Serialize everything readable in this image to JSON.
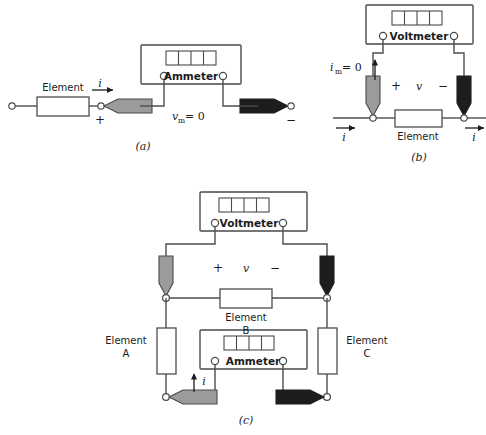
{
  "figure": {
    "background": "#ffffff",
    "colors": {
      "wire": "#4d4d4d",
      "probe_gray": "#9b9b9b",
      "probe_black": "#1d1d1d",
      "text": "#1b1b1b"
    }
  },
  "panel_a": {
    "caption": "(a)",
    "meter": {
      "name": "Ammeter",
      "display_segments": 4,
      "terminals": 2
    },
    "element_label": "Element",
    "current_label": "i",
    "plus_sign": "+",
    "minus_sign": "−",
    "meter_voltage": {
      "symbol": "v",
      "subscript": "m",
      "equals": "= 0",
      "full": "vₘ = 0"
    },
    "probes": [
      {
        "name": "positive-probe",
        "color": "gray",
        "direction": "left"
      },
      {
        "name": "negative-probe",
        "color": "black",
        "direction": "right"
      }
    ]
  },
  "panel_b": {
    "caption": "(b)",
    "meter": {
      "name": "Voltmeter",
      "display_segments": 4,
      "terminals": 2
    },
    "element_label": "Element",
    "voltage_label": "v",
    "plus_sign": "+",
    "minus_sign": "−",
    "current_label_left": "i",
    "current_label_right": "i",
    "meter_current": {
      "symbol": "i",
      "subscript": "m",
      "equals": "= 0",
      "full": "iₘ = 0"
    },
    "probes": [
      {
        "name": "positive-probe",
        "color": "gray",
        "direction": "down"
      },
      {
        "name": "negative-probe",
        "color": "black",
        "direction": "down"
      }
    ]
  },
  "panel_c": {
    "caption": "(c)",
    "voltmeter": {
      "name": "Voltmeter",
      "display_segments": 4,
      "terminals": 2
    },
    "ammeter": {
      "name": "Ammeter",
      "display_segments": 4,
      "terminals": 2
    },
    "elements": [
      {
        "name": "element-a",
        "label": "Element",
        "sublabel": "A",
        "orientation": "vertical"
      },
      {
        "name": "element-b",
        "label": "Element",
        "sublabel": "B",
        "orientation": "horizontal"
      },
      {
        "name": "element-c",
        "label": "Element",
        "sublabel": "C",
        "orientation": "vertical"
      }
    ],
    "voltage_label": "v",
    "plus_sign": "+",
    "minus_sign": "−",
    "current_label": "i",
    "probes": [
      {
        "name": "voltmeter-positive-probe",
        "color": "gray",
        "direction": "down"
      },
      {
        "name": "voltmeter-negative-probe",
        "color": "black",
        "direction": "down"
      },
      {
        "name": "ammeter-positive-probe",
        "color": "gray",
        "direction": "left"
      },
      {
        "name": "ammeter-negative-probe",
        "color": "black",
        "direction": "right"
      }
    ]
  }
}
